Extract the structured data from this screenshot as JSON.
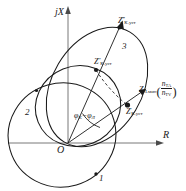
{
  "figure": {
    "type": "impedance-plane-diagram",
    "axes": {
      "vertical_label": "jX",
      "horizontal_label": "R",
      "origin_label": "O"
    },
    "curve_numbers": [
      {
        "id": "1",
        "label": "1"
      },
      {
        "id": "2",
        "label": "2"
      },
      {
        "id": "3",
        "label": "3"
      }
    ],
    "points": [
      {
        "id": "z-k-set-3",
        "base": "Z",
        "prime": "‴",
        "sub": "К.уст"
      },
      {
        "id": "z-k-set-2",
        "base": "Z",
        "prime": "″",
        "sub": "К.уст"
      },
      {
        "id": "z-k-set-1",
        "base": "Z",
        "prime": "′",
        "sub": "К.уст"
      }
    ],
    "vector_label": {
      "id": "z-l-min",
      "base": "Z",
      "sub": "Л.мин",
      "numerator": "n",
      "numerator_sub": "ТА",
      "denominator": "n",
      "denominator_sub": "ТV"
    },
    "angle_label": {
      "id": "phi-difference",
      "text": "φ",
      "sub1": "К",
      "minus": "−",
      "text2": "φ",
      "sub2": "Л"
    },
    "colors": {
      "stroke": "#1a1a1a",
      "background": "#ffffff",
      "axis": "#555555"
    }
  }
}
